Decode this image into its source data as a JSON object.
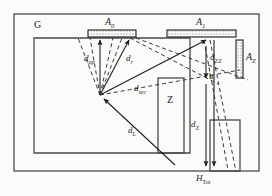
{
  "figure": {
    "type": "technical-schematic",
    "stroke_color": "#3a3a3a",
    "hatch_color": "#8a8a8a",
    "background": "#fbfbfa"
  },
  "labels": {
    "room": "G",
    "zone": "Z",
    "surface_a0": "A",
    "surface_a0_sub": "0",
    "surface_a1": "A",
    "surface_a1_sub": "1",
    "surface_az": "A",
    "surface_az_sub": "Z",
    "dist_pp": "d",
    "dist_pp_sub": "pp",
    "dist_r": "d",
    "dist_r_sub": "r",
    "dist_sec": "d",
    "dist_sec_sub": "sec",
    "dist_l": "d",
    "dist_l_sub": "L",
    "dist_zz": "d",
    "dist_zz_sub": "ZZ",
    "dist_z": "d",
    "dist_z_sub": "Z",
    "height_tot": "H",
    "height_tot_sub": "Tot",
    "point_b": "b"
  }
}
